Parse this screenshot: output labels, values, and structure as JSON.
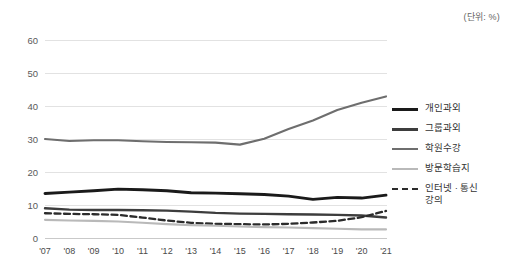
{
  "unit_note": "(단위: %)",
  "legend": {
    "position": "right",
    "items": [
      {
        "label": "개인과외",
        "color": "#1a1a1a",
        "width": 3.0,
        "dash": "none"
      },
      {
        "label": "그룹과외",
        "color": "#3d3d3d",
        "width": 2.6,
        "dash": "none"
      },
      {
        "label": "학원수강",
        "color": "#6e6e6e",
        "width": 2.2,
        "dash": "none"
      },
      {
        "label": "방문학습지",
        "color": "#b9b9b9",
        "width": 2.2,
        "dash": "none"
      },
      {
        "label": "인터넷 · 통신\n강의",
        "color": "#2b2b2b",
        "width": 2.4,
        "dash": "5,3"
      }
    ]
  },
  "chart_data": {
    "type": "line",
    "title": "",
    "subtitle": "",
    "xlabel": "",
    "ylabel": "",
    "unit": "%",
    "grid": true,
    "legend_position": "right",
    "ylim": [
      0,
      60
    ],
    "yticks": [
      0,
      10,
      20,
      30,
      40,
      50,
      60
    ],
    "categories": [
      "'07",
      "'08",
      "'09",
      "'10",
      "'11",
      "'12",
      "'13",
      "'14",
      "'15",
      "'16",
      "'17",
      "'18",
      "'19",
      "'20",
      "'21"
    ],
    "series": [
      {
        "name": "학원수강",
        "color": "#6e6e6e",
        "style": "solid",
        "values": [
          30.0,
          29.4,
          29.6,
          29.6,
          29.3,
          29.1,
          29.0,
          28.9,
          28.3,
          30.1,
          33.0,
          35.6,
          38.8,
          41.0,
          42.9
        ]
      },
      {
        "name": "개인과외",
        "color": "#1a1a1a",
        "style": "solid",
        "values": [
          13.5,
          13.9,
          14.3,
          14.8,
          14.6,
          14.3,
          13.7,
          13.6,
          13.4,
          13.2,
          12.7,
          11.7,
          12.3,
          12.1,
          13.0
        ]
      },
      {
        "name": "그룹과외",
        "color": "#3d3d3d",
        "style": "solid",
        "values": [
          9.0,
          8.6,
          8.5,
          8.5,
          8.4,
          8.3,
          8.0,
          7.6,
          7.4,
          7.3,
          7.2,
          7.1,
          7.0,
          6.8,
          6.2
        ]
      },
      {
        "name": "인터넷 · 통신강의",
        "color": "#2b2b2b",
        "style": "dashed",
        "values": [
          7.5,
          7.3,
          7.2,
          7.0,
          6.2,
          5.3,
          4.6,
          4.3,
          4.2,
          4.1,
          4.3,
          4.7,
          5.2,
          6.3,
          8.2
        ]
      },
      {
        "name": "방문학습지",
        "color": "#b9b9b9",
        "style": "solid",
        "values": [
          5.5,
          5.3,
          5.2,
          5.0,
          4.6,
          4.2,
          3.9,
          3.7,
          3.5,
          3.3,
          3.2,
          3.0,
          2.8,
          2.6,
          2.6
        ]
      }
    ]
  }
}
